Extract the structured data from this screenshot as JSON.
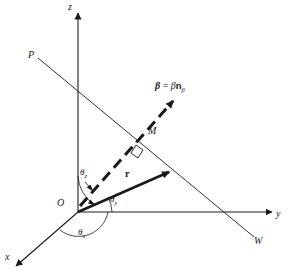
{
  "figure": {
    "type": "3d-coordinate-vector-diagram",
    "background_color": "#ffffff",
    "line_color": "#1a1a1a",
    "width": 292,
    "height": 277
  },
  "axes": [
    {
      "id": "z",
      "label": "z",
      "label_x": 68,
      "label_y": 2,
      "description": "vertical axis pointing up"
    },
    {
      "id": "y",
      "label": "y",
      "label_x": 276,
      "label_y": 209,
      "description": "horizontal axis pointing right"
    },
    {
      "id": "x",
      "label": "x",
      "label_x": 5,
      "label_y": 252,
      "description": "oblique axis pointing down-left"
    }
  ],
  "points": [
    {
      "id": "O",
      "label": "O",
      "label_x": 57,
      "label_y": 198,
      "description": "origin"
    },
    {
      "id": "M",
      "label": "M",
      "label_x": 148,
      "label_y": 126,
      "description": "point on line PW"
    },
    {
      "id": "P",
      "label": "P",
      "label_x": 28,
      "label_y": 50,
      "description": "upper-left end of oblique line"
    },
    {
      "id": "W",
      "label": "W",
      "label_x": 254,
      "label_y": 236,
      "description": "lower-right end of oblique line"
    }
  ],
  "vectors": [
    {
      "id": "r",
      "label": "r",
      "label_x": 125,
      "label_y": 169,
      "style": "solid-bold-arrow",
      "from": "O",
      "to": "intersection with line PW"
    },
    {
      "id": "beta",
      "label_parts": {
        "bold_beta": "β",
        "equals": "=",
        "scalar_beta": "β",
        "n_bold": "n",
        "subscript": "β"
      },
      "label_text": "β = βnβ",
      "label_x": 155,
      "label_y": 81,
      "style": "dashed-bold-arrow",
      "from": "O",
      "to": "direction up-right past M"
    }
  ],
  "angles": [
    {
      "id": "theta_z",
      "symbol": "θ",
      "subscript": "z",
      "label_x": 80,
      "label_y": 168,
      "description": "angle from z axis to r"
    },
    {
      "id": "theta_y",
      "symbol": "θ",
      "subscript": "y",
      "label_x": 110,
      "label_y": 195,
      "description": "angle from y axis to r"
    },
    {
      "id": "theta_x",
      "symbol": "θ",
      "subscript": "x",
      "label_x": 78,
      "label_y": 228,
      "description": "angle from x axis to r"
    }
  ],
  "marks": [
    {
      "id": "right-angle",
      "description": "right angle square where r meets line PW",
      "x": 130,
      "y": 142
    }
  ],
  "lines": [
    {
      "id": "line-PW",
      "from": "P",
      "to": "W",
      "style": "thin-solid"
    }
  ]
}
